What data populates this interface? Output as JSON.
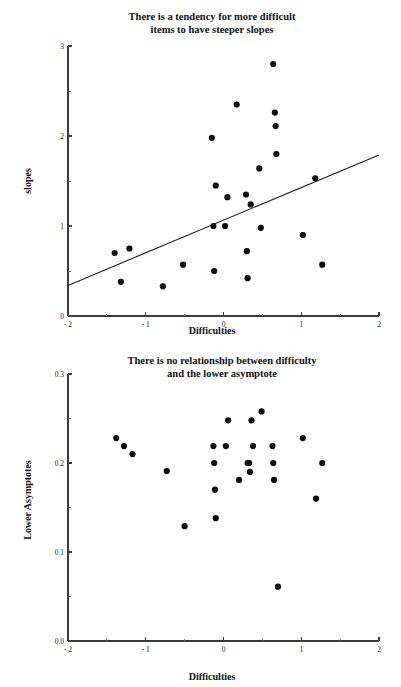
{
  "page": {
    "background": "#ffffff",
    "accent": "#0a0a0a",
    "width": 401,
    "height": 687
  },
  "chart_data": [
    {
      "id": "slopes-vs-difficulties",
      "type": "scatter",
      "title": "There is a tendency for more difficult\nitems to have steeper slopes",
      "title_line1": "There is a tendency for more difficult",
      "title_line2": "items to have steeper slopes",
      "xlabel": "Difficulties",
      "ylabel": "slopes",
      "xlim": [
        -2,
        2
      ],
      "ylim": [
        0,
        3
      ],
      "xticks": [
        -2,
        -1,
        0,
        1,
        2
      ],
      "xtick_labels": [
        "- 2",
        "- 1",
        "0",
        "1",
        "2"
      ],
      "xticks_minor": [
        -1.5,
        -0.5,
        0.5,
        1.5
      ],
      "yticks": [
        0,
        1,
        2,
        3
      ],
      "ytick_labels": [
        "0",
        "1",
        "2",
        "3"
      ],
      "yticks_minor": [
        0.5,
        1.5,
        2.5
      ],
      "grid": false,
      "legend": false,
      "marker": "filled-circle",
      "points": [
        {
          "x": -1.4,
          "y": 0.7
        },
        {
          "x": -1.32,
          "y": 0.38
        },
        {
          "x": -1.21,
          "y": 0.75
        },
        {
          "x": -0.78,
          "y": 0.33
        },
        {
          "x": -0.52,
          "y": 0.57
        },
        {
          "x": -0.15,
          "y": 1.98
        },
        {
          "x": -0.13,
          "y": 1.0
        },
        {
          "x": -0.12,
          "y": 0.5
        },
        {
          "x": -0.1,
          "y": 1.45
        },
        {
          "x": 0.02,
          "y": 1.0
        },
        {
          "x": 0.05,
          "y": 1.32
        },
        {
          "x": 0.17,
          "y": 2.35
        },
        {
          "x": 0.29,
          "y": 1.35
        },
        {
          "x": 0.3,
          "y": 0.72
        },
        {
          "x": 0.31,
          "y": 0.42
        },
        {
          "x": 0.35,
          "y": 1.24
        },
        {
          "x": 0.46,
          "y": 1.64
        },
        {
          "x": 0.48,
          "y": 0.98
        },
        {
          "x": 0.64,
          "y": 2.8
        },
        {
          "x": 0.66,
          "y": 2.26
        },
        {
          "x": 0.67,
          "y": 2.11
        },
        {
          "x": 0.68,
          "y": 1.8
        },
        {
          "x": 1.02,
          "y": 0.9
        },
        {
          "x": 1.18,
          "y": 1.53
        },
        {
          "x": 1.27,
          "y": 0.57
        }
      ],
      "fit_line": {
        "x_start": -2,
        "y_start": 0.34,
        "x_end": 2,
        "y_end": 1.79,
        "slope": 0.3625,
        "intercept": 1.065
      }
    },
    {
      "id": "lower-asymptotes-vs-difficulties",
      "type": "scatter",
      "title": "There is no relationship between difficulty\nand the lower asymptote",
      "title_line1": "There is no relationship between difficulty",
      "title_line2": "and the lower asymptote",
      "xlabel": "Difficulties",
      "ylabel": "Lower Asymptotes",
      "xlim": [
        -2,
        2
      ],
      "ylim": [
        0.0,
        0.3
      ],
      "xticks": [
        -2,
        -1,
        0,
        1,
        2
      ],
      "xtick_labels": [
        "- 2",
        "- 1",
        "0",
        "1",
        "2"
      ],
      "xticks_minor": [
        -1.5,
        -0.5,
        0.5,
        1.5
      ],
      "yticks": [
        0.0,
        0.1,
        0.2,
        0.3
      ],
      "ytick_labels": [
        "0.0",
        "0.1",
        "0.2",
        "0.3"
      ],
      "yticks_minor": [
        0.05,
        0.15,
        0.25
      ],
      "grid": false,
      "legend": false,
      "marker": "filled-circle",
      "points": [
        {
          "x": -1.38,
          "y": 0.228
        },
        {
          "x": -1.28,
          "y": 0.219
        },
        {
          "x": -1.17,
          "y": 0.21
        },
        {
          "x": -0.73,
          "y": 0.191
        },
        {
          "x": -0.5,
          "y": 0.129
        },
        {
          "x": -0.13,
          "y": 0.219
        },
        {
          "x": -0.12,
          "y": 0.2
        },
        {
          "x": -0.11,
          "y": 0.17
        },
        {
          "x": -0.1,
          "y": 0.138
        },
        {
          "x": 0.03,
          "y": 0.219
        },
        {
          "x": 0.06,
          "y": 0.248
        },
        {
          "x": 0.2,
          "y": 0.181
        },
        {
          "x": 0.31,
          "y": 0.2
        },
        {
          "x": 0.33,
          "y": 0.2
        },
        {
          "x": 0.34,
          "y": 0.19
        },
        {
          "x": 0.36,
          "y": 0.248
        },
        {
          "x": 0.38,
          "y": 0.219
        },
        {
          "x": 0.49,
          "y": 0.258
        },
        {
          "x": 0.63,
          "y": 0.219
        },
        {
          "x": 0.64,
          "y": 0.2
        },
        {
          "x": 0.65,
          "y": 0.181
        },
        {
          "x": 0.7,
          "y": 0.061
        },
        {
          "x": 1.02,
          "y": 0.228
        },
        {
          "x": 1.19,
          "y": 0.16
        },
        {
          "x": 1.27,
          "y": 0.2
        }
      ]
    }
  ]
}
